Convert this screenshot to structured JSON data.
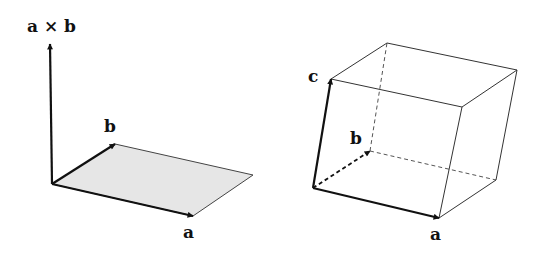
{
  "left_figure": {
    "description": "Cross product of vectors a and b, perpendicular to shaded parallelogram",
    "labels": {
      "cross": "a × b",
      "b": "b",
      "a": "a"
    },
    "parallelogram_fill": "#e6e6e6"
  },
  "right_figure": {
    "description": "Parallelepiped spanned by vectors a, b, c",
    "labels": {
      "c": "c",
      "b": "b",
      "a": "a"
    }
  },
  "colors": {
    "stroke": "#111111",
    "thin_stroke": "#555555",
    "background": "#ffffff"
  }
}
